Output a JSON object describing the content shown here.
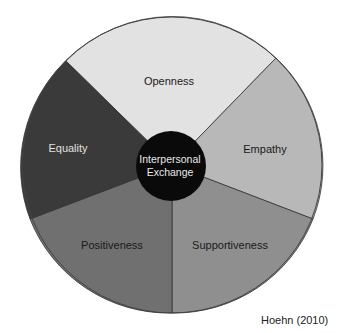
{
  "diagram": {
    "title": "Interpersonal Exchange",
    "center": {
      "line1": "Interpersonal",
      "line2": "Exchange",
      "color": "#0a0a0a",
      "text_color": "#e8e8e8"
    },
    "segments": [
      {
        "label": "Openness",
        "color": "#e2e2e2",
        "text_color": "#1a1a1a"
      },
      {
        "label": "Empathy",
        "color": "#b8b8b8",
        "text_color": "#1a1a1a"
      },
      {
        "label": "Supportiveness",
        "color": "#8f8f8f",
        "text_color": "#1a1a1a"
      },
      {
        "label": "Positiveness",
        "color": "#707070",
        "text_color": "#1a1a1a"
      },
      {
        "label": "Equality",
        "color": "#3a3a3a",
        "text_color": "#e0e0e0"
      }
    ],
    "credit": "Hoehn (2010)"
  }
}
